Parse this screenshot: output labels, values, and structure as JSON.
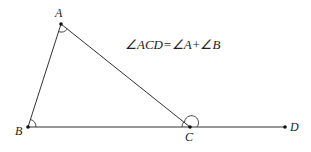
{
  "diagram": {
    "type": "geometry-triangle-exterior-angle",
    "points": {
      "A": {
        "label": "A",
        "x": 61,
        "y": 24
      },
      "B": {
        "label": "B",
        "x": 28,
        "y": 127
      },
      "C": {
        "label": "C",
        "x": 190,
        "y": 127
      },
      "D": {
        "label": "D",
        "x": 285,
        "y": 127
      }
    },
    "segments": [
      {
        "from": "A",
        "to": "B"
      },
      {
        "from": "A",
        "to": "C"
      },
      {
        "from": "B",
        "to": "D"
      }
    ],
    "angle_marks": [
      "A",
      "B",
      "ACB",
      "ACD"
    ],
    "equation": "∠ACD=∠A+∠B"
  }
}
